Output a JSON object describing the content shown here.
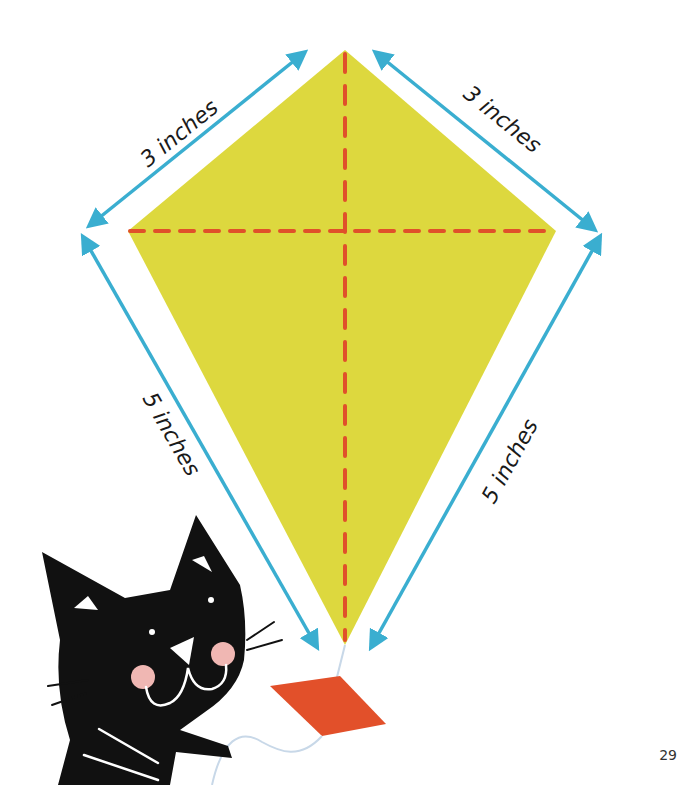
{
  "diagram": {
    "labels": {
      "top_left": "3 inches",
      "top_right": "3 inches",
      "bottom_left": "5 inches",
      "bottom_right": "5 inches"
    },
    "colors": {
      "kite_fill": "#ddd83e",
      "dashed_line": "#e0502a",
      "arrow": "#3aaed0",
      "tail": "#e2502a",
      "cat": "#111111",
      "cheek": "#f0b7b3",
      "string": "#c8d8e8"
    }
  },
  "page": {
    "number": "29"
  }
}
